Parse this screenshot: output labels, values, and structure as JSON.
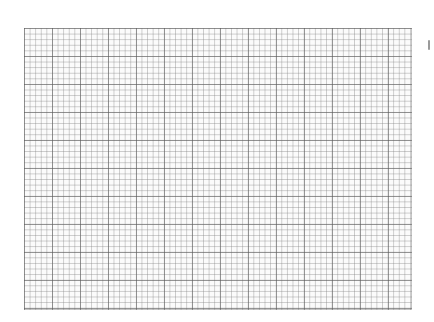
{
  "image": {
    "description": "Blank sheet of graph paper with fine gray grid",
    "grid": {
      "minor_spacing_px": 5.6,
      "major_every_minor": 5,
      "line_color": "#8a8a8a",
      "paper_color": "#fbfbfb"
    },
    "background_color": "#ffffff"
  }
}
